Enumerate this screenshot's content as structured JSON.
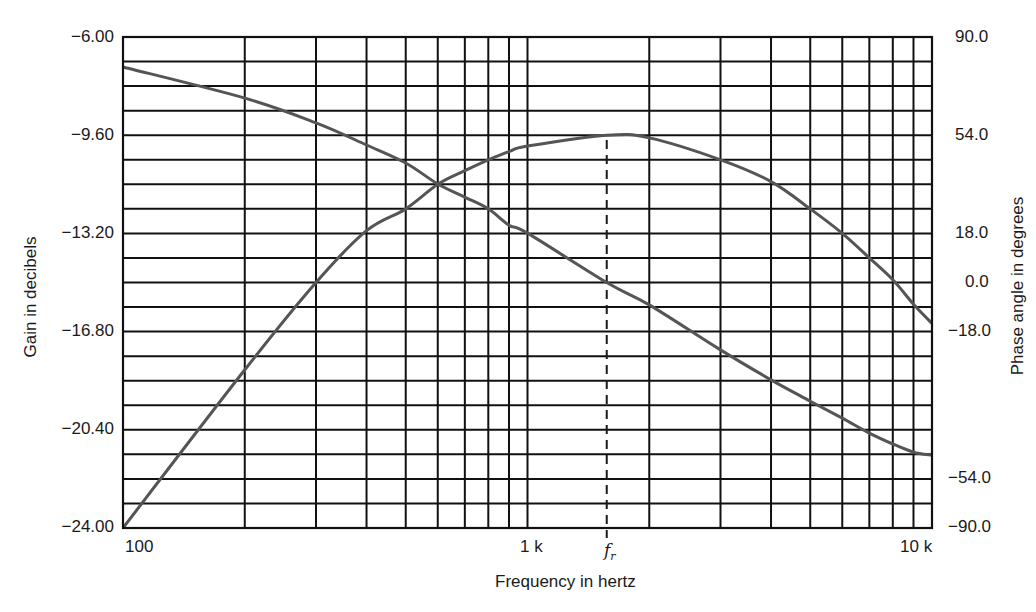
{
  "chart_data": {
    "type": "line",
    "title": "",
    "xlabel": "Frequency in hertz",
    "ylabel": "Gain in decibels",
    "y2label": "Phase angle in degrees",
    "xscale": "log",
    "xlim": [
      100,
      10000
    ],
    "ylim": [
      -24.0,
      -6.0
    ],
    "y2lim": [
      -90.0,
      90.0
    ],
    "grid": true,
    "x_tick_labels": [
      {
        "value": 100,
        "label": "100"
      },
      {
        "value": 1000,
        "label": "1 k"
      },
      {
        "value": 10000,
        "label": "10 k"
      }
    ],
    "x_gridlines": [
      100,
      200,
      300,
      400,
      500,
      600,
      700,
      800,
      900,
      1000,
      2000,
      3000,
      4000,
      5000,
      6000,
      7000,
      8000,
      9000,
      10000
    ],
    "y_tick_labels": [
      "-6.00",
      "-9.60",
      "-13.20",
      "-16.80",
      "-20.40",
      "-24.00"
    ],
    "y_tick_values": [
      -6.0,
      -9.6,
      -13.2,
      -16.8,
      -20.4,
      -24.0
    ],
    "y2_tick_labels": [
      "90.0",
      "54.0",
      "18.0",
      "0.0",
      "-18.0",
      "-54.0",
      "-90.0"
    ],
    "y2_tick_values": [
      90.0,
      54.0,
      18.0,
      0.0,
      -18.0,
      -54.0,
      -90.0
    ],
    "y_minor_divisions": 20,
    "annotation": {
      "label": "f",
      "subscript": "r",
      "x": 1570,
      "style": "dashed vertical line"
    },
    "x": [
      100,
      200,
      300,
      400,
      500,
      600,
      700,
      800,
      900,
      1000,
      1570,
      2000,
      3000,
      4000,
      5000,
      6000,
      7000,
      8000,
      9000,
      10000
    ],
    "series": [
      {
        "name": "Gain (dB)",
        "axis": "left",
        "color": "#555555",
        "values": [
          -24.0,
          -18.2,
          -15.0,
          -13.1,
          -12.3,
          -11.4,
          -10.9,
          -10.5,
          -10.2,
          -10.0,
          -9.6,
          -9.7,
          -10.5,
          -11.3,
          -12.3,
          -13.2,
          -14.1,
          -14.9,
          -15.8,
          -16.5
        ]
      },
      {
        "name": "Phase angle (degrees)",
        "axis": "right",
        "color": "#555555",
        "values": [
          79.0,
          67.6,
          58.5,
          50.4,
          43.8,
          36.1,
          31.3,
          27.0,
          21.0,
          18.1,
          0.0,
          -8.2,
          -24.7,
          -35.7,
          -43.5,
          -49.7,
          -55.2,
          -59.2,
          -62.2,
          -63.3
        ]
      }
    ],
    "legend": null
  },
  "labels": {
    "y_axis_title": "Gain in decibels",
    "y2_axis_title": "Phase angle in degrees",
    "x_axis_title": "Frequency in hertz",
    "x_ticks": [
      "100",
      "1 k",
      "10 k"
    ],
    "y_ticks": [
      "−6.00",
      "−9.60",
      "−13.20",
      "−16.80",
      "−20.40",
      "−24.00"
    ],
    "y2_ticks": [
      "90.0",
      "54.0",
      "18.0",
      "0.0",
      "−18.0",
      "−54.0",
      "−90.0"
    ],
    "fr_main": "f",
    "fr_sub": "r"
  }
}
